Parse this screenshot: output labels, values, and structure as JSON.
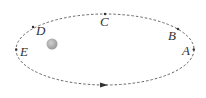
{
  "diagram": {
    "points": [
      {
        "label": "A",
        "x": 185,
        "y": 55
      },
      {
        "label": "B",
        "x": 172,
        "y": 40
      },
      {
        "label": "C",
        "x": 105,
        "y": 26
      },
      {
        "label": "D",
        "x": 38,
        "y": 37
      },
      {
        "label": "E",
        "x": 22,
        "y": 56
      }
    ],
    "sun": {
      "cx": 52,
      "cy": 44,
      "r": 5.5,
      "color": "#a9a9a9"
    },
    "orbit": {
      "cx": 105,
      "cy": 49.5,
      "rx": 89,
      "ry": 35.5,
      "color": "#555555"
    },
    "direction_arrow": "counterclockwise (rightward at bottom)"
  }
}
